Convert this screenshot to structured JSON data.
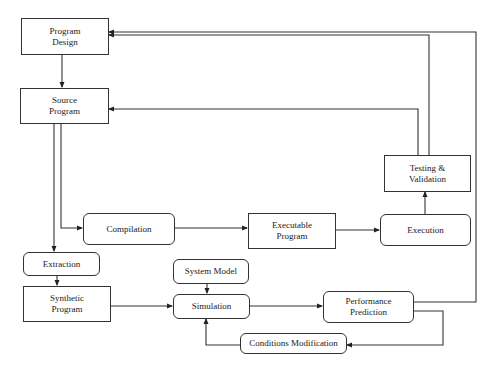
{
  "diagram": {
    "type": "flowchart",
    "nodes": [
      {
        "id": "program_design",
        "label": "Program\nDesign",
        "shape": "rect"
      },
      {
        "id": "source_program",
        "label": "Source\nProgram",
        "shape": "rect"
      },
      {
        "id": "compilation",
        "label": "Compilation",
        "shape": "rounded"
      },
      {
        "id": "executable_program",
        "label": "Executable\nProgram",
        "shape": "rect"
      },
      {
        "id": "execution",
        "label": "Execution",
        "shape": "rounded"
      },
      {
        "id": "testing_validation",
        "label": "Testing &\nValidation",
        "shape": "rect"
      },
      {
        "id": "extraction",
        "label": "Extraction",
        "shape": "rounded"
      },
      {
        "id": "synthetic_program",
        "label": "Synthetic\nProgram",
        "shape": "rect"
      },
      {
        "id": "system_model",
        "label": "System Model",
        "shape": "rounded"
      },
      {
        "id": "simulation",
        "label": "Simulation",
        "shape": "rounded"
      },
      {
        "id": "performance_prediction",
        "label": "Performance\nPrediction",
        "shape": "rounded"
      },
      {
        "id": "conditions_modification",
        "label": "Conditions Modification",
        "shape": "rounded"
      }
    ],
    "edges": [
      {
        "from": "program_design",
        "to": "source_program"
      },
      {
        "from": "source_program",
        "to": "compilation"
      },
      {
        "from": "source_program",
        "to": "extraction"
      },
      {
        "from": "compilation",
        "to": "executable_program"
      },
      {
        "from": "executable_program",
        "to": "execution"
      },
      {
        "from": "execution",
        "to": "testing_validation"
      },
      {
        "from": "testing_validation",
        "to": "source_program"
      },
      {
        "from": "testing_validation",
        "to": "program_design"
      },
      {
        "from": "extraction",
        "to": "synthetic_program"
      },
      {
        "from": "synthetic_program",
        "to": "simulation"
      },
      {
        "from": "system_model",
        "to": "simulation"
      },
      {
        "from": "simulation",
        "to": "performance_prediction"
      },
      {
        "from": "performance_prediction",
        "to": "program_design"
      },
      {
        "from": "performance_prediction",
        "to": "conditions_modification"
      },
      {
        "from": "conditions_modification",
        "to": "simulation"
      }
    ]
  }
}
